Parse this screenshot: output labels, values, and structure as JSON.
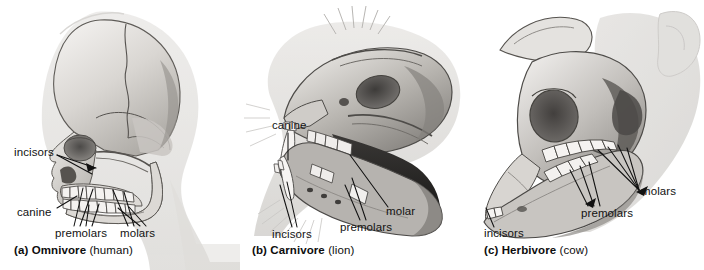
{
  "figure": {
    "style": "grayscale anatomical line-and-tone drawing",
    "panel_count": 3
  },
  "panels": [
    {
      "id": "a",
      "caption_bold": "(a) Omnivore",
      "caption_paren": "(human)",
      "subject": "human skull, lateral view",
      "labels": [
        {
          "name": "incisors",
          "text": "incisors"
        },
        {
          "name": "canine",
          "text": "canine"
        },
        {
          "name": "premolars",
          "text": "premolars"
        },
        {
          "name": "molars",
          "text": "molars"
        }
      ]
    },
    {
      "id": "b",
      "caption_bold": "(b) Carnivore",
      "caption_paren": "(lion)",
      "subject": "lion skull with open jaw, lateral view",
      "labels": [
        {
          "name": "canine",
          "text": "canine"
        },
        {
          "name": "incisors",
          "text": "incisors"
        },
        {
          "name": "premolars",
          "text": "premolars"
        },
        {
          "name": "molar",
          "text": "molar"
        }
      ]
    },
    {
      "id": "c",
      "caption_bold": "(c) Herbivore",
      "caption_paren": "(cow)",
      "subject": "cow skull, lateral view",
      "labels": [
        {
          "name": "molars",
          "text": "molars"
        },
        {
          "name": "premolars",
          "text": "premolars"
        },
        {
          "name": "incisors",
          "text": "incisors"
        }
      ]
    }
  ],
  "colors": {
    "background": "#ffffff",
    "ink": "#121212",
    "bone_light": "#e8e6e2",
    "bone_mid": "#b8b5b0",
    "bone_dark": "#6e6b67",
    "shadow": "#4a4846",
    "silhouette": "#d8d6d3"
  },
  "cropped_text_line": ""
}
